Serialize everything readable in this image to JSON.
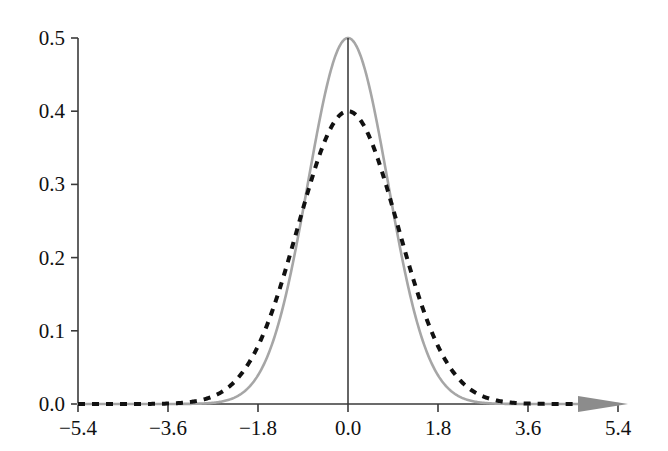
{
  "chart_data": {
    "type": "line",
    "title": "",
    "xlabel": "",
    "ylabel": "",
    "xlim": [
      -5.4,
      5.4
    ],
    "ylim": [
      0.0,
      0.5
    ],
    "grid": false,
    "legend": "none",
    "x_ticks": [
      "−5.4",
      "−3.6",
      "−1.8",
      "0.0",
      "1.8",
      "3.6",
      "5.4"
    ],
    "x_tick_values": [
      -5.4,
      -3.6,
      -1.8,
      0.0,
      1.8,
      3.6,
      5.4
    ],
    "y_ticks": [
      "0.0",
      "0.1",
      "0.2",
      "0.3",
      "0.4",
      "0.5"
    ],
    "y_tick_values": [
      0.0,
      0.1,
      0.2,
      0.3,
      0.4,
      0.5
    ],
    "series": [
      {
        "name": "gray-solid-curve",
        "style": "solid",
        "color": "#a6a6a6",
        "width": 2.6,
        "peak_x": 0.0,
        "peak_y": 0.5,
        "sigma": 0.7979,
        "mu": 0.0,
        "x": [
          -5.4,
          -5.0,
          -4.6,
          -4.2,
          -3.8,
          -3.4,
          -3.0,
          -2.6,
          -2.2,
          -1.8,
          -1.4,
          -1.0,
          -0.6,
          -0.2,
          0.0,
          0.2,
          0.6,
          1.0,
          1.4,
          1.8,
          2.2,
          2.6,
          3.0,
          3.4,
          3.8,
          4.2,
          4.6,
          5.0,
          5.4
        ],
        "values": [
          0.0,
          0.0,
          0.0,
          0.0,
          0.0005,
          0.0026,
          0.0098,
          0.0294,
          0.0708,
          0.1367,
          0.212,
          0.287,
          0.3897,
          0.4845,
          0.5,
          0.4845,
          0.3897,
          0.287,
          0.212,
          0.1367,
          0.0708,
          0.0294,
          0.0098,
          0.0026,
          0.0005,
          0.0,
          0.0,
          0.0,
          0.0
        ]
      },
      {
        "name": "black-dashed-curve",
        "style": "dashed",
        "color": "#111111",
        "width": 4.0,
        "peak_x": 0.0,
        "peak_y": 0.4,
        "sigma": 1.0,
        "mu": 0.0,
        "x": [
          -5.4,
          -5.0,
          -4.6,
          -4.2,
          -3.8,
          -3.4,
          -3.0,
          -2.6,
          -2.2,
          -1.8,
          -1.4,
          -1.0,
          -0.6,
          -0.2,
          0.0,
          0.2,
          0.6,
          1.0,
          1.4,
          1.8,
          2.2,
          2.6,
          3.0,
          3.4,
          3.8,
          4.2,
          4.6,
          5.0,
          5.4
        ],
        "values": [
          0.0,
          0.0,
          0.0,
          0.0001,
          0.0003,
          0.0012,
          0.0044,
          0.0136,
          0.0355,
          0.079,
          0.1497,
          0.242,
          0.3332,
          0.391,
          0.3989,
          0.391,
          0.3332,
          0.242,
          0.1497,
          0.079,
          0.0355,
          0.0136,
          0.0044,
          0.0012,
          0.0003,
          0.0001,
          0.0,
          0.0,
          0.0
        ]
      }
    ],
    "annotations": [
      {
        "name": "center-vertical-line",
        "type": "vline",
        "x": 0.0,
        "y_from": 0.0,
        "y_to": 0.5,
        "color": "#333333"
      },
      {
        "name": "x-axis-arrowhead",
        "type": "arrow",
        "x": 5.0,
        "color": "#8c8c8c"
      }
    ]
  },
  "axes": {
    "axis_color": "#3a3a3a",
    "x_axis_label": "",
    "y_axis_label": ""
  }
}
